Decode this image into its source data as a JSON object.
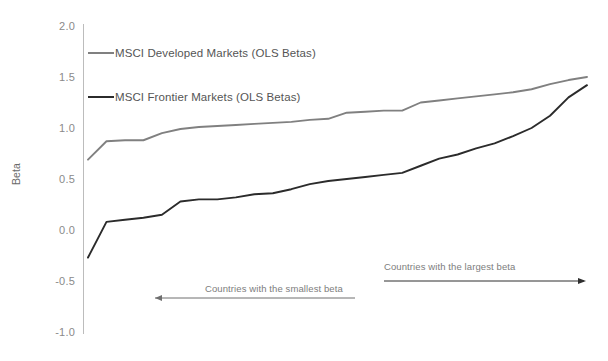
{
  "chart_data": {
    "type": "line",
    "title": "",
    "xlabel": "",
    "ylabel": "Beta",
    "ylim": [
      -1.0,
      2.0
    ],
    "yticks": [
      "2.0",
      "1.5",
      "1.0",
      "0.5",
      "0.0",
      "-0.5",
      "-1.0"
    ],
    "ytick_values": [
      2.0,
      1.5,
      1.0,
      0.5,
      0.0,
      -0.5,
      -1.0
    ],
    "xtick_labels": [],
    "grid": false,
    "legend_position": "inside-upper-left",
    "series": [
      {
        "name": "MSCI Developed Markets (OLS Betas)",
        "color": "#808080",
        "values": [
          0.69,
          0.87,
          0.88,
          0.88,
          0.95,
          0.99,
          1.01,
          1.02,
          1.03,
          1.04,
          1.05,
          1.06,
          1.08,
          1.09,
          1.15,
          1.16,
          1.17,
          1.17,
          1.25,
          1.27,
          1.29,
          1.31,
          1.33,
          1.35,
          1.38,
          1.43,
          1.47,
          1.5
        ]
      },
      {
        "name": "MSCI Frontier Markets (OLS Betas)",
        "color": "#2b2b2b",
        "values": [
          -0.27,
          0.08,
          0.1,
          0.12,
          0.15,
          0.28,
          0.3,
          0.3,
          0.32,
          0.35,
          0.36,
          0.4,
          0.45,
          0.48,
          0.5,
          0.52,
          0.54,
          0.56,
          0.63,
          0.7,
          0.74,
          0.8,
          0.85,
          0.92,
          1.0,
          1.12,
          1.3,
          1.42
        ]
      }
    ],
    "annotations": [
      {
        "id": "smallest-beta",
        "text": "Countries with the smallest beta",
        "arrow_direction": "left"
      },
      {
        "id": "largest-beta",
        "text": "Countries with the largest beta",
        "arrow_direction": "right"
      }
    ],
    "colors": {
      "developed": "#808080",
      "frontier": "#2b2b2b",
      "axis": "#bcbcbc",
      "tick_text": "#8a8a8a",
      "annotation_text": "#7d7d7d",
      "background": "#ffffff"
    }
  }
}
